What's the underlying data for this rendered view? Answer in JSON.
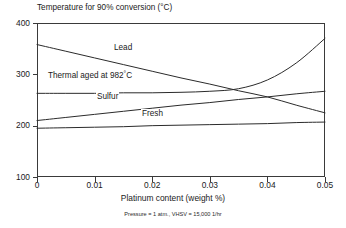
{
  "chart_data": {
    "type": "line",
    "title": "Temperature for 90% conversion (°C)",
    "xlabel": "Platinum content (weight %)",
    "ylabel": "Temperature for 90% conversion (°C)",
    "footnote": "Pressure = 1 atm., VHSV = 15,000 1/hr",
    "xlim": [
      0,
      0.05
    ],
    "ylim": [
      100,
      400
    ],
    "xticks": [
      0,
      0.01,
      0.02,
      0.03,
      0.04,
      0.05
    ],
    "xtick_labels": [
      "0",
      "0.01",
      "0.02",
      "0.03",
      "0.04",
      "0.05"
    ],
    "yticks": [
      100,
      200,
      300,
      400
    ],
    "ytick_labels": [
      "100",
      "200",
      "300",
      "400"
    ],
    "grid": false,
    "legend": "inline-labels",
    "line_color": "#2b2b2b",
    "series": [
      {
        "name": "Lead",
        "label": "Lead",
        "label_html": "Lead",
        "x": [
          0,
          0.005,
          0.01,
          0.015,
          0.02,
          0.025,
          0.03,
          0.035,
          0.04,
          0.045,
          0.05
        ],
        "values": [
          358,
          345,
          332,
          319,
          306,
          293,
          281,
          268,
          256,
          240,
          225
        ]
      },
      {
        "name": "Thermal aged at 982C",
        "label": "Thermal aged at 982°C",
        "label_html": "Thermal aged at 982<span class=\"sup\">°</span>C",
        "x": [
          0,
          0.005,
          0.01,
          0.015,
          0.02,
          0.025,
          0.03,
          0.035,
          0.04,
          0.045,
          0.05
        ],
        "values": [
          263,
          263,
          263,
          264,
          264,
          265,
          267,
          272,
          289,
          322,
          370
        ]
      },
      {
        "name": "Sulfur",
        "label": "Sulfur",
        "label_html": "Sulfur",
        "x": [
          0,
          0.005,
          0.01,
          0.015,
          0.02,
          0.025,
          0.03,
          0.035,
          0.04,
          0.045,
          0.05
        ],
        "values": [
          210,
          216,
          222,
          228,
          234,
          240,
          245,
          251,
          256,
          262,
          267
        ]
      },
      {
        "name": "Fresh",
        "label": "Fresh",
        "label_html": "Fresh",
        "x": [
          0,
          0.005,
          0.01,
          0.015,
          0.02,
          0.025,
          0.03,
          0.035,
          0.04,
          0.045,
          0.05
        ],
        "values": [
          195,
          196,
          197,
          198,
          200,
          201,
          202,
          203,
          204,
          206,
          207
        ]
      }
    ],
    "annotations": [
      {
        "name": "Lead",
        "text": "Lead",
        "x": 0.0133,
        "y": 343
      },
      {
        "name": "Thermal aged at 982C",
        "text": "Thermal aged at 982°C",
        "x": 0.0025,
        "y": 292
      },
      {
        "name": "Sulfur",
        "text": "Sulfur",
        "x": 0.0105,
        "y": 248
      },
      {
        "name": "Fresh",
        "text": "Fresh",
        "x": 0.0225,
        "y": 215
      }
    ]
  }
}
